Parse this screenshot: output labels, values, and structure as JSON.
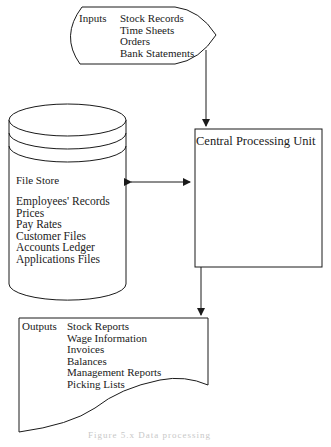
{
  "inputs": {
    "label": "Inputs",
    "items": [
      "Stock Records",
      "Time Sheets",
      "Orders",
      "Bank Statements"
    ]
  },
  "cpu": {
    "label": "Central Processing Unit"
  },
  "file_store": {
    "label": "File Store",
    "items": [
      "Employees' Records",
      "Prices",
      "Pay Rates",
      "Customer Files",
      "Accounts Ledger",
      "Applications Files"
    ]
  },
  "outputs": {
    "label": "Outputs",
    "items": [
      "Stock Reports",
      "Wage Information",
      "Invoices",
      "Balances",
      "Management Reports",
      "Picking Lists"
    ]
  },
  "caption": "Figure 5.x  Data processing"
}
